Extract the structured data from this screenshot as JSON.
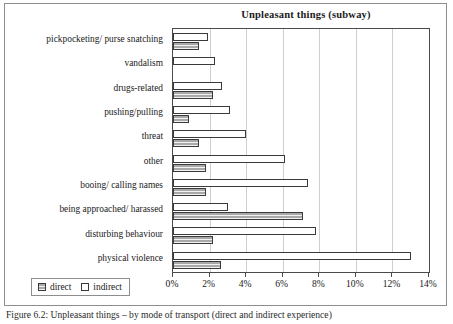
{
  "figure": {
    "caption": "Figure 6.2: Unpleasant things – by mode of transport (direct and indirect experience)"
  },
  "chart_data": {
    "type": "bar",
    "orientation": "horizontal",
    "title": "Unpleasant things (subway)",
    "xlabel": "",
    "ylabel": "",
    "xlim": [
      0,
      14
    ],
    "xticks": [
      0,
      2,
      4,
      6,
      8,
      10,
      12,
      14
    ],
    "xtick_labels": [
      "0%",
      "2%",
      "4%",
      "6%",
      "8%",
      "10%",
      "12%",
      "14%"
    ],
    "grid": true,
    "legend_position": "bottom-left",
    "categories": [
      "pickpocketing/ purse snatching",
      "vandalism",
      "drugs-related",
      "pushing/pulling",
      "threat",
      "other",
      "booing/ calling names",
      "being approached/ harassed",
      "disturbing behaviour",
      "physical violence"
    ],
    "series": [
      {
        "name": "direct",
        "color": "#a9a9a9",
        "values": [
          1.4,
          0,
          2.2,
          0.9,
          1.4,
          1.8,
          1.8,
          7.1,
          2.2,
          2.6
        ]
      },
      {
        "name": "indirect",
        "color": "#ffffff",
        "values": [
          1.9,
          2.3,
          2.7,
          3.1,
          4.0,
          6.1,
          7.4,
          3.0,
          7.8,
          13.0
        ]
      }
    ]
  }
}
